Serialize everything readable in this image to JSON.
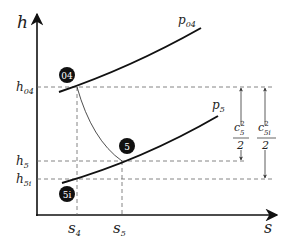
{
  "diagram": {
    "axes": {
      "y_label": "h",
      "x_label": "s",
      "y_ticks": [
        {
          "base": "h",
          "sub": "04"
        },
        {
          "base": "h",
          "sub": "5"
        },
        {
          "base": "h",
          "sub": "5i"
        }
      ],
      "x_ticks": [
        {
          "base": "s",
          "sub": "4"
        },
        {
          "base": "s",
          "sub": "5"
        }
      ]
    },
    "isobars": [
      {
        "base": "p",
        "sub": "04"
      },
      {
        "base": "p",
        "sub": "5"
      }
    ],
    "nodes": [
      {
        "label": "04"
      },
      {
        "label": "5"
      },
      {
        "label": "5i"
      }
    ],
    "dimensions": [
      {
        "num_base": "c",
        "num_sub": "5",
        "num_sup": "2",
        "den": "2"
      },
      {
        "num_base": "c",
        "num_sub": "5i",
        "num_sup": "2",
        "den": "2"
      }
    ],
    "colors": {
      "line": "#111111",
      "dashed": "#666666",
      "node_fill": "#111111",
      "node_text": "#ffffff"
    }
  }
}
